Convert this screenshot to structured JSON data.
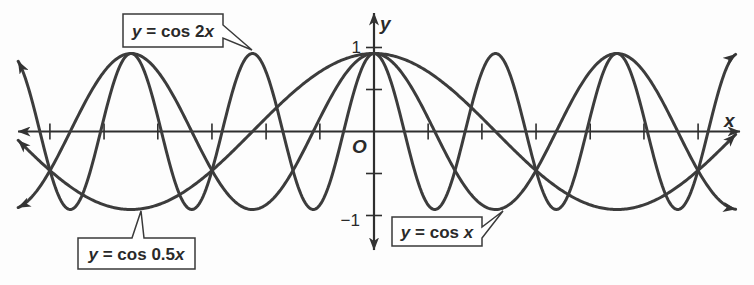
{
  "chart_data": {
    "type": "line",
    "title": "",
    "xlabel": "x",
    "ylabel": "y",
    "origin_label": "O",
    "xlim": [
      -9.42,
      9.42
    ],
    "ylim": [
      -1,
      1
    ],
    "plot_domain": [
      -9.2,
      9.35
    ],
    "grid": false,
    "legend": "none (callout labels on curves)",
    "x_ticks": [
      -8.38,
      -6.98,
      -5.59,
      -4.19,
      -2.79,
      -1.4,
      1.4,
      2.79,
      4.19,
      5.59,
      6.98,
      8.38
    ],
    "x_tick_labels": [],
    "y_ticks": [
      -1,
      -0.5,
      0.5,
      1
    ],
    "y_tick_labels": [
      {
        "value": 1,
        "label": "1"
      },
      {
        "value": -1,
        "label": "−1"
      }
    ],
    "x_sample_in_pi": [
      -2.5,
      -2,
      -1.5,
      -1,
      -0.5,
      0,
      0.5,
      1,
      1.5,
      2,
      2.5
    ],
    "series": [
      {
        "id": "cos-x",
        "name": "y = cos x",
        "function": "cos(x)",
        "k": 1,
        "color": "#3c3c3c",
        "values": [
          0,
          1,
          0,
          -1,
          0,
          1,
          0,
          -1,
          0,
          1,
          0
        ],
        "label_parts": [
          "y",
          " = cos ",
          "x"
        ],
        "callout_points_to": {
          "x": "π",
          "y": -1
        }
      },
      {
        "id": "cos-2x",
        "name": "y = cos 2x",
        "function": "cos(2x)",
        "k": 2,
        "color": "#3c3c3c",
        "values": [
          -1,
          1,
          -1,
          1,
          -1,
          1,
          -1,
          1,
          -1,
          1,
          -1
        ],
        "label_parts": [
          "y",
          " = cos 2",
          "x"
        ],
        "callout_points_to": {
          "x": "−π",
          "y": 1
        }
      },
      {
        "id": "cos-0-5x",
        "name": "y = cos 0.5x",
        "function": "cos(0.5x)",
        "k": 0.5,
        "color": "#3c3c3c",
        "values": [
          -0.707,
          -1,
          -0.707,
          0,
          0.707,
          1,
          0.707,
          0,
          -0.707,
          -1,
          -0.707
        ],
        "label_parts": [
          "y",
          " = cos 0.5",
          "x"
        ],
        "callout_points_to": {
          "x": "−2π",
          "y": -1
        }
      }
    ]
  },
  "colors": {
    "background": "#fdfdfd",
    "axis": "#2e2e2e",
    "curve": "#3c3c3c",
    "callout_border": "#3a3a3a"
  }
}
